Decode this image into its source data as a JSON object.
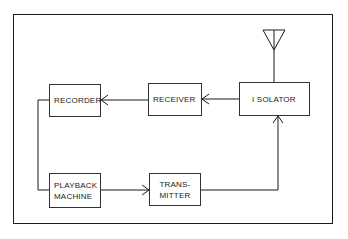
{
  "diagram": {
    "type": "block-diagram",
    "frame": true,
    "colors": {
      "stroke": "#1a1a1a",
      "background": "#ffffff",
      "text": "#222222"
    },
    "blocks": [
      {
        "id": "recorder",
        "label_lines": [
          "RECORDER"
        ]
      },
      {
        "id": "receiver",
        "label_lines": [
          "RECEIVER"
        ]
      },
      {
        "id": "isolator",
        "label_lines": [
          "I SOLATOR"
        ]
      },
      {
        "id": "playback",
        "label_lines": [
          "PLAYBACK",
          "MACHINE"
        ]
      },
      {
        "id": "transmitter",
        "label_lines": [
          "TRANS-",
          "MITTER"
        ]
      }
    ],
    "antenna": {
      "attached_to": "isolator",
      "icon": "antenna-icon"
    },
    "connections": [
      {
        "from": "isolator",
        "to": "receiver",
        "arrow": true
      },
      {
        "from": "receiver",
        "to": "recorder",
        "arrow": true
      },
      {
        "from": "recorder",
        "to": "playback",
        "arrow": false
      },
      {
        "from": "playback",
        "to": "transmitter",
        "arrow": true
      },
      {
        "from": "transmitter",
        "to": "isolator",
        "arrow": true
      },
      {
        "from": "antenna",
        "to": "isolator",
        "arrow": false
      }
    ]
  }
}
